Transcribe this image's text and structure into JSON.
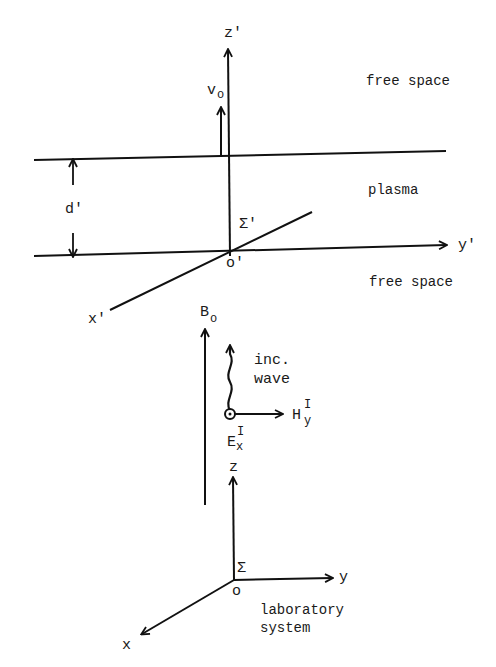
{
  "figure": {
    "moving_frame": {
      "axis_z": "z'",
      "axis_y": "y'",
      "axis_x": "x'",
      "origin": "o'",
      "frame_symbol": "Σ'",
      "velocity_label": "v",
      "velocity_subscript": "o",
      "thickness_label": "d'"
    },
    "regions": {
      "top": "free space",
      "middle": "plasma",
      "bottom": "free space"
    },
    "field": {
      "label": "B",
      "subscript": "o"
    },
    "incident_wave": {
      "line1": "inc.",
      "line2": "wave",
      "H_label": "H",
      "H_superscript": "I",
      "H_subscript": "y",
      "E_label": "E",
      "E_superscript": "I",
      "E_subscript": "x"
    },
    "lab_frame": {
      "axis_z": "z",
      "axis_y": "y",
      "axis_x": "x",
      "origin": "o",
      "frame_symbol": "Σ",
      "caption_line1": "laboratory",
      "caption_line2": "system"
    }
  }
}
